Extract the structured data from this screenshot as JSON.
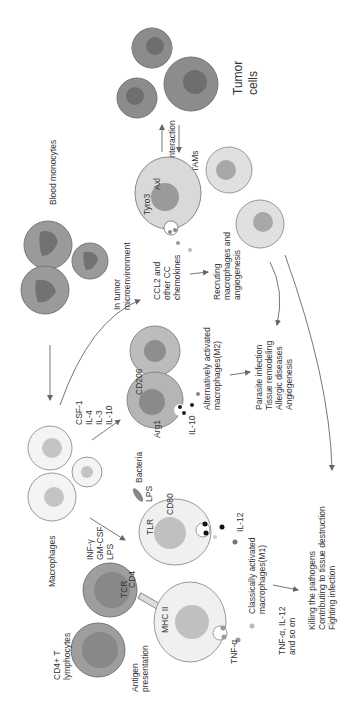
{
  "labels": {
    "tumor_cells": [
      "Tumor",
      "cells"
    ],
    "blood_monocytes": "Blood monocytes",
    "interaction": "Interaction",
    "tams": "TAMs",
    "tyro3": "Tyro3",
    "axl": "Axl",
    "in_tumor": [
      "In tumor",
      "microenvironment"
    ],
    "ccl2": [
      "CCL2 and",
      "other CC",
      "chemokines"
    ],
    "recruiting": [
      "Recruting",
      "macrophages and",
      "angiogenesis"
    ],
    "csf": [
      "CSF-1",
      "IL-4",
      "IL-3",
      "IL-10"
    ],
    "cd206": "CD206",
    "arg1": "Arg1",
    "il10": "IL-10",
    "m2": [
      "Alternatively activated",
      "macrophages(M2)"
    ],
    "m2_outcomes": [
      "Parasite infection",
      "Tissue remodeling",
      "Allergic diseases",
      "Angiogenesis"
    ],
    "macrophages": "Macrophages",
    "bacteria": "Bacteria",
    "lps": "LPS",
    "tlr": "TLR",
    "cd80": "CD80",
    "il12": "IL-12",
    "inf": [
      "INF-γ",
      "GM-CSF",
      "LPS"
    ],
    "tcr": "TCR",
    "cd4": "CD4",
    "mhc": "MHC II",
    "tnf": "TNF-α",
    "m1": [
      "Classically activated",
      "macrophages(M1)"
    ],
    "m1_secreted": [
      "TNF-α, IL-12",
      "and so on"
    ],
    "m1_outcomes": [
      "Killing the pathogens",
      "Contributing to tissue destruction",
      "Fighting infection"
    ],
    "cd4t": [
      "CD4+ T",
      "lymphocytes"
    ],
    "antigen": [
      "Antigen",
      "presentation"
    ]
  },
  "colors": {
    "tumor": "#8a8a8a",
    "tumor_nucleus": "#6a6a6a",
    "monocyte": "#9a9a9a",
    "monocyte_nucleus": "#707070",
    "macrophage": "#f2f2f2",
    "macrophage_nucleus": "#bdbdbd",
    "tam": "#d6d6d6",
    "m2": "#b8b8b8",
    "tcell": "#9c9c9c"
  }
}
